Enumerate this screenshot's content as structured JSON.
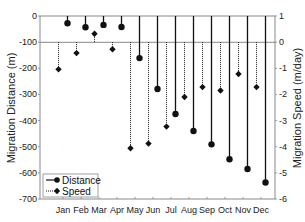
{
  "chart_data": {
    "type": "bar",
    "title": "",
    "categories": [
      "Jan",
      "Feb",
      "Mar",
      "Apr",
      "May",
      "Jun",
      "Jul",
      "Aug",
      "Sep",
      "Oct",
      "Nov",
      "Dec"
    ],
    "series": [
      {
        "name": "Distance",
        "axis": "left",
        "style": "solid-stem-circle",
        "values": [
          -28,
          -43,
          -34,
          -42,
          -161,
          -279,
          -375,
          -440,
          -491,
          -548,
          -585,
          -637
        ]
      },
      {
        "name": "Speed",
        "axis": "right",
        "style": "dotted-stem-diamond",
        "values": [
          -1.04,
          -0.42,
          0.32,
          -0.27,
          -4.06,
          -3.88,
          -3.23,
          -2.1,
          -1.72,
          -1.85,
          -1.22,
          -1.72
        ]
      }
    ],
    "ylabel": "Migration Distance (m)",
    "y2label": "Migration Speed (m/day)",
    "xlabel": "",
    "ylim": [
      -700,
      0
    ],
    "y2lim": [
      -6,
      1
    ],
    "yticks": [
      "0",
      "-100",
      "-200",
      "-300",
      "-400",
      "-500",
      "-600",
      "-700"
    ],
    "y2ticks": [
      "1",
      "0",
      "-1",
      "-2",
      "-3",
      "-4",
      "-5",
      "-6"
    ],
    "baseline": {
      "left": -100,
      "right": 0
    },
    "grid": false,
    "legend": {
      "position": "bottom-left",
      "entries": [
        "Distance",
        "Speed"
      ]
    }
  }
}
